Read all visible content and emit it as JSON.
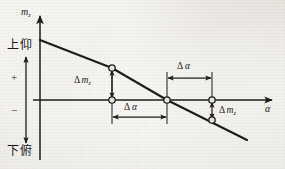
{
  "figure": {
    "name": "pitching-moment-coefficient-vs-angle-of-attack",
    "background_color": "#e8e6e1",
    "ink_color": "#1b1b1b"
  },
  "axes": {
    "y_axis": {
      "label_symbol": "m",
      "label_subscript": "z",
      "direction": "up",
      "x_px": 40,
      "top_px": 12,
      "bottom_px": 160
    },
    "x_axis": {
      "label_symbol": "α",
      "direction": "right",
      "y_px": 100,
      "left_px": 33,
      "right_px": 277
    }
  },
  "axis_annotations": {
    "positive_region_label": "上仰",
    "positive_sign": "+",
    "negative_sign": "−",
    "negative_region_label": "下俯",
    "direction_arrow_name": "sign-direction-double-arrow"
  },
  "curve": {
    "type": "line",
    "description": "descending pitching-moment curve crossing the alpha axis",
    "points_px": [
      [
        40,
        40
      ],
      [
        112,
        68
      ],
      [
        167,
        100
      ],
      [
        247,
        140
      ]
    ],
    "stroke_width": 2.1
  },
  "markers": [
    {
      "name": "marker-upper-left",
      "x_px": 112,
      "y_px": 68,
      "on_curve": true
    },
    {
      "name": "marker-axis-left",
      "x_px": 112,
      "y_px": 100,
      "on_curve": false
    },
    {
      "name": "marker-axis-center",
      "x_px": 167,
      "y_px": 100,
      "on_curve": true
    },
    {
      "name": "marker-axis-right",
      "x_px": 212,
      "y_px": 100,
      "on_curve": false
    },
    {
      "name": "marker-lower-right",
      "x_px": 212,
      "y_px": 120,
      "on_curve": true
    }
  ],
  "annotations": [
    {
      "id": "delta-mz-left",
      "symbol": "Δ",
      "quantity": "m",
      "subscript": "z",
      "text": "Δ m",
      "orientation": "vertical",
      "arrow": "double-headed",
      "x_px": 112,
      "y_top_px": 68,
      "y_bottom_px": 100,
      "label_x_px": 75,
      "label_y_px": 78
    },
    {
      "id": "delta-alpha-lower",
      "symbol": "Δ",
      "quantity": "α",
      "text": "Δ α",
      "orientation": "horizontal",
      "arrow": "double-headed",
      "y_px": 117,
      "x_left_px": 112,
      "x_right_px": 167,
      "label_x_px": 125,
      "label_y_px": 103
    },
    {
      "id": "delta-alpha-upper",
      "symbol": "Δ",
      "quantity": "α",
      "text": "Δ α",
      "orientation": "horizontal",
      "arrow": "double-headed",
      "y_px": 78,
      "x_left_px": 167,
      "x_right_px": 212,
      "label_x_px": 178,
      "label_y_px": 62
    },
    {
      "id": "delta-mz-right",
      "symbol": "Δ",
      "quantity": "m",
      "subscript": "z",
      "text": "Δ m",
      "orientation": "vertical",
      "arrow": "double-headed",
      "x_px": 212,
      "y_top_px": 100,
      "y_bottom_px": 120,
      "label_x_px": 218,
      "label_y_px": 107
    }
  ],
  "text": {
    "y_axis_symbol": "m",
    "y_axis_subscript": "z",
    "x_axis_symbol": "α",
    "up_label": "上仰",
    "down_label": "下俯",
    "plus": "+",
    "minus": "−",
    "delta": "Δ",
    "m_symbol": "m",
    "m_subscript": "z",
    "alpha_symbol": "α"
  }
}
